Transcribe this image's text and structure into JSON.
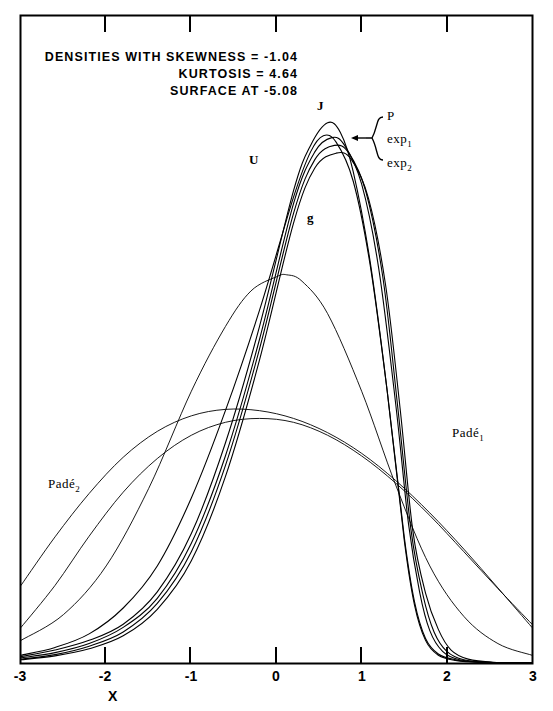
{
  "figure": {
    "title_lines": [
      "DENSITIES WITH SKEWNESS = -1.04",
      "KURTOSIS = 4.64",
      "SURFACE AT -5.08"
    ],
    "xaxis_title": "X",
    "tick_labels": [
      "-3",
      "-2",
      "-1",
      "0",
      "1",
      "2",
      "3"
    ],
    "curve_labels": {
      "J": "J",
      "U": "U",
      "g": "g",
      "P": "P",
      "exp1": "exp",
      "exp1_sub": "1",
      "exp2": "exp",
      "exp2_sub": "2",
      "pade1": "Padé",
      "pade1_sub": "1",
      "pade2": "Padé",
      "pade2_sub": "2"
    },
    "colors": {
      "ink": "#000000",
      "background": "#ffffff"
    }
  },
  "chart_data": {
    "type": "line",
    "title": "DENSITIES WITH SKEWNESS = -1.04 KURTOSIS = 4.64 SURFACE AT -5.08",
    "xlabel": "X",
    "ylabel": "",
    "xlim": [
      -3,
      3
    ],
    "ylim": [
      0,
      1.0
    ],
    "grid": false,
    "legend_position": "inline-annotations",
    "xticks": [
      -3,
      -2,
      -1,
      0,
      1,
      2,
      3
    ],
    "xticklabels": [
      "-3",
      "-2",
      "-1",
      "0",
      "1",
      "2",
      "3"
    ],
    "annotations": [
      {
        "text": "DENSITIES WITH SKEWNESS = -1.04",
        "x": -2.3,
        "y": 0.93
      },
      {
        "text": "KURTOSIS = 4.64",
        "x": -1.0,
        "y": 0.885
      },
      {
        "text": "SURFACE AT -5.08",
        "x": -1.1,
        "y": 0.84
      },
      {
        "text": "J",
        "x": 0.43,
        "y": 0.79
      },
      {
        "text": "U",
        "x": -0.02,
        "y": 0.665
      },
      {
        "text": "g",
        "x": 0.55,
        "y": 0.575
      },
      {
        "text": "P",
        "x": 1.03,
        "y": 0.755
      },
      {
        "text": "exp1",
        "x": 1.03,
        "y": 0.7
      },
      {
        "text": "exp2",
        "x": 1.03,
        "y": 0.645
      },
      {
        "text": "Pade1",
        "x": 2.15,
        "y": 0.345
      },
      {
        "text": "Pade2",
        "x": -2.35,
        "y": 0.275
      }
    ],
    "series": [
      {
        "name": "J",
        "note": "Johnson-type skewed density, sharp peak near x=0.6",
        "x": [
          -3.0,
          -2.6,
          -2.2,
          -1.8,
          -1.4,
          -1.0,
          -0.6,
          -0.2,
          0.2,
          0.4,
          0.6,
          0.75,
          0.9,
          1.1,
          1.3,
          1.5,
          1.62,
          1.75,
          1.9,
          2.1,
          2.4,
          3.0
        ],
        "values": [
          0.01,
          0.02,
          0.035,
          0.06,
          0.11,
          0.2,
          0.34,
          0.52,
          0.73,
          0.8,
          0.835,
          0.82,
          0.76,
          0.62,
          0.42,
          0.19,
          0.09,
          0.035,
          0.012,
          0.004,
          0.001,
          0.0
        ]
      },
      {
        "name": "U",
        "note": "Unimodal alternative, broader left flank, peak slightly left of J",
        "x": [
          -3.0,
          -2.6,
          -2.2,
          -1.8,
          -1.4,
          -1.0,
          -0.6,
          -0.2,
          0.2,
          0.4,
          0.55,
          0.7,
          0.9,
          1.1,
          1.3,
          1.5,
          1.62,
          1.75,
          1.9,
          2.1,
          2.4,
          3.0
        ],
        "values": [
          0.012,
          0.024,
          0.045,
          0.085,
          0.15,
          0.255,
          0.39,
          0.545,
          0.72,
          0.79,
          0.815,
          0.805,
          0.745,
          0.615,
          0.42,
          0.195,
          0.095,
          0.038,
          0.014,
          0.005,
          0.001,
          0.0
        ]
      },
      {
        "name": "P",
        "note": "Pearson-type density, peak marginally right and lower than J",
        "x": [
          -3.0,
          -2.6,
          -2.2,
          -1.8,
          -1.4,
          -1.0,
          -0.6,
          -0.2,
          0.2,
          0.45,
          0.65,
          0.8,
          1.0,
          1.2,
          1.4,
          1.55,
          1.68,
          1.8,
          1.95,
          2.15,
          2.5,
          3.0
        ],
        "values": [
          0.008,
          0.016,
          0.03,
          0.055,
          0.1,
          0.185,
          0.32,
          0.5,
          0.71,
          0.79,
          0.812,
          0.8,
          0.74,
          0.61,
          0.4,
          0.215,
          0.11,
          0.05,
          0.018,
          0.005,
          0.001,
          0.0
        ]
      },
      {
        "name": "exp1",
        "note": "First exponential-family approximation, near-coincident with P",
        "x": [
          -3.0,
          -2.6,
          -2.2,
          -1.8,
          -1.4,
          -1.0,
          -0.6,
          -0.2,
          0.2,
          0.45,
          0.68,
          0.85,
          1.05,
          1.25,
          1.42,
          1.58,
          1.72,
          1.85,
          2.0,
          2.2,
          2.5,
          3.0
        ],
        "values": [
          0.006,
          0.013,
          0.026,
          0.048,
          0.092,
          0.172,
          0.305,
          0.485,
          0.695,
          0.778,
          0.8,
          0.788,
          0.728,
          0.595,
          0.4,
          0.205,
          0.105,
          0.048,
          0.018,
          0.005,
          0.001,
          0.0
        ]
      },
      {
        "name": "exp2",
        "note": "Second exponential-family approximation, slightly wider right shoulder",
        "x": [
          -3.0,
          -2.6,
          -2.2,
          -1.8,
          -1.4,
          -1.0,
          -0.6,
          -0.2,
          0.2,
          0.45,
          0.7,
          0.88,
          1.08,
          1.28,
          1.45,
          1.6,
          1.75,
          1.9,
          2.05,
          2.25,
          2.55,
          3.0
        ],
        "values": [
          0.005,
          0.011,
          0.022,
          0.042,
          0.083,
          0.158,
          0.288,
          0.468,
          0.68,
          0.765,
          0.788,
          0.778,
          0.718,
          0.585,
          0.395,
          0.205,
          0.108,
          0.052,
          0.02,
          0.006,
          0.001,
          0.0
        ]
      },
      {
        "name": "g",
        "note": "Gaussian reference density, peak near x=0.12, height about 0.60",
        "x": [
          -3.0,
          -2.5,
          -2.0,
          -1.5,
          -1.0,
          -0.6,
          -0.3,
          0.0,
          0.12,
          0.3,
          0.6,
          1.0,
          1.4,
          1.8,
          2.2,
          2.6,
          3.0
        ],
        "values": [
          0.035,
          0.075,
          0.15,
          0.27,
          0.42,
          0.52,
          0.575,
          0.597,
          0.6,
          0.59,
          0.54,
          0.42,
          0.275,
          0.15,
          0.072,
          0.03,
          0.012
        ]
      },
      {
        "name": "Pade1",
        "note": "First Pade approximant, very flat broad mound peaking left of centre",
        "x": [
          -3.0,
          -2.6,
          -2.2,
          -1.8,
          -1.4,
          -1.0,
          -0.6,
          -0.2,
          0.2,
          0.6,
          1.0,
          1.4,
          1.8,
          2.2,
          2.6,
          3.0
        ],
        "values": [
          0.12,
          0.195,
          0.262,
          0.318,
          0.358,
          0.382,
          0.392,
          0.39,
          0.378,
          0.356,
          0.324,
          0.282,
          0.232,
          0.176,
          0.116,
          0.055
        ]
      },
      {
        "name": "Pade2",
        "note": "Second Pade approximant, broad mound peaking near x=-0.2, crosses Pade1",
        "x": [
          -3.0,
          -2.6,
          -2.2,
          -1.8,
          -1.4,
          -1.0,
          -0.6,
          -0.2,
          0.2,
          0.6,
          1.0,
          1.4,
          1.8,
          2.2,
          2.6,
          3.0
        ],
        "values": [
          0.055,
          0.12,
          0.196,
          0.264,
          0.316,
          0.352,
          0.372,
          0.378,
          0.372,
          0.352,
          0.32,
          0.278,
          0.228,
          0.172,
          0.115,
          0.06
        ]
      }
    ]
  }
}
